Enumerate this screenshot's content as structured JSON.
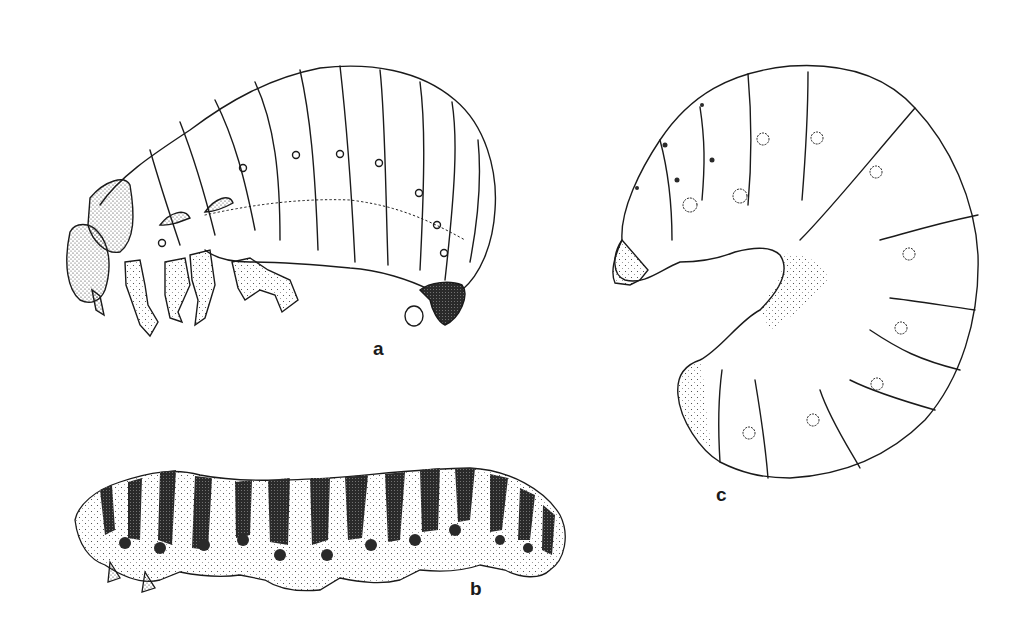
{
  "plate": {
    "description": "Scientific line-drawing plate of three insect larvae",
    "background": "#ffffff",
    "ink": "#1a1a1a"
  },
  "figures": [
    {
      "id": "a",
      "label": "a",
      "subject": "beetle grub, lateral view with three pairs of thoracic legs, stippled head capsule"
    },
    {
      "id": "b",
      "label": "b",
      "subject": "caterpillar, lateral view with dark banded pattern"
    },
    {
      "id": "c",
      "label": "c",
      "subject": "C-shaped scarab grub, lateral view with spiracles"
    }
  ]
}
